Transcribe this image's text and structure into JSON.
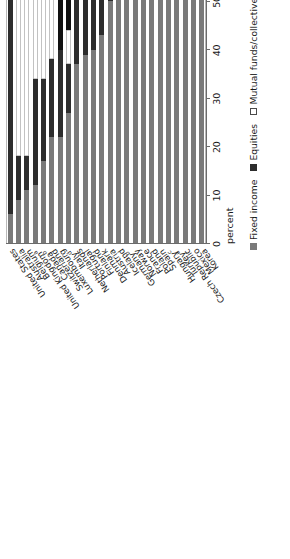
{
  "chart_data": {
    "type": "bar",
    "orientation": "horizontal-stacked",
    "title": "",
    "xlabel": "percent",
    "ylabel": "",
    "xlim": [
      0,
      100
    ],
    "grid": false,
    "legend_position": "bottom",
    "tick_labels": [
      "100",
      "90",
      "80",
      "70",
      "60",
      "50",
      "40",
      "30",
      "20",
      "10",
      "0"
    ],
    "tick_values": [
      100,
      90,
      80,
      70,
      60,
      50,
      40,
      30,
      20,
      10,
      0
    ],
    "axis_title": "percent",
    "series": [
      {
        "name": "Fixed income",
        "color": "#7a7a7a",
        "swatch": "fixed"
      },
      {
        "name": "Equities",
        "color": "#2d2d2d",
        "swatch": "equities"
      },
      {
        "name": "Mutual funds/collective investment schemes",
        "color": "#ffffff",
        "swatch": "mutual"
      },
      {
        "name": "Other",
        "color": "#111111",
        "swatch": "other"
      }
    ],
    "categories": [
      "United States",
      "Australia",
      "Belgium",
      "United Kingdom",
      "Canada",
      "Switzerland",
      "Luxembourg",
      "Italy",
      "Netherlands",
      "Portugal",
      "Finland",
      "Denmark",
      "Austria",
      "Iceland",
      "Germany",
      "Norway",
      "France",
      "Poland",
      "Spain",
      "Hungary",
      "Turkey",
      "Czech Republic",
      "Mexico",
      "Korea"
    ],
    "category_footnotes": {
      "United Kingdom": "a",
      "Switzerland": "b",
      "Italy": "d",
      "Germany": "b",
      "Hungary": "c",
      "Turkey": "a"
    },
    "rows": [
      {
        "category": "United States",
        "footnote": "",
        "fixed": 6,
        "equities": 60,
        "mutual": 28,
        "other": 6
      },
      {
        "category": "Australia",
        "footnote": "",
        "fixed": 9,
        "equities": 9,
        "mutual": 80,
        "other": 2
      },
      {
        "category": "Belgium",
        "footnote": "",
        "fixed": 11,
        "equities": 7,
        "mutual": 65,
        "other": 17
      },
      {
        "category": "United Kingdom",
        "footnote": "a",
        "fixed": 12,
        "equities": 22,
        "mutual": 45,
        "other": 21
      },
      {
        "category": "Canada",
        "footnote": "b",
        "fixed": 17,
        "equities": 17,
        "mutual": 52,
        "other": 14
      },
      {
        "category": "Switzerland",
        "footnote": "",
        "fixed": 22,
        "equities": 16,
        "mutual": 39,
        "other": 23
      },
      {
        "category": "Luxembourg",
        "footnote": "",
        "fixed": 22,
        "equities": 18,
        "mutual": 0,
        "other": 60
      },
      {
        "category": "Italy",
        "footnote": "d",
        "fixed": 27,
        "equities": 10,
        "mutual": 7,
        "other": 56
      },
      {
        "category": "Netherlands",
        "footnote": "",
        "fixed": 37,
        "equities": 48,
        "mutual": 0,
        "other": 15
      },
      {
        "category": "Portugal",
        "footnote": "",
        "fixed": 39,
        "equities": 26,
        "mutual": 23,
        "other": 12
      },
      {
        "category": "Finland",
        "footnote": "",
        "fixed": 40,
        "equities": 49,
        "mutual": 0,
        "other": 11
      },
      {
        "category": "Denmark",
        "footnote": "",
        "fixed": 43,
        "equities": 27,
        "mutual": 14,
        "other": 16
      },
      {
        "category": "Austria",
        "footnote": "",
        "fixed": 50,
        "equities": 39,
        "mutual": 0,
        "other": 11
      },
      {
        "category": "Iceland",
        "footnote": "",
        "fixed": 52,
        "equities": 42,
        "mutual": 2,
        "other": 4
      },
      {
        "category": "Germany",
        "footnote": "b",
        "fixed": 53,
        "equities": 36,
        "mutual": 0,
        "other": 11
      },
      {
        "category": "Norway",
        "footnote": "",
        "fixed": 55,
        "equities": 38,
        "mutual": 0,
        "other": 7
      },
      {
        "category": "France",
        "footnote": "",
        "fixed": 60,
        "equities": 6,
        "mutual": 28,
        "other": 6
      },
      {
        "category": "Poland",
        "footnote": "",
        "fixed": 62,
        "equities": 38,
        "mutual": 0,
        "other": 0
      },
      {
        "category": "Spain",
        "footnote": "",
        "fixed": 68,
        "equities": 13,
        "mutual": 9,
        "other": 10
      },
      {
        "category": "Hungary",
        "footnote": "c",
        "fixed": 71,
        "equities": 10,
        "mutual": 9,
        "other": 10
      },
      {
        "category": "Turkey",
        "footnote": "a",
        "fixed": 83,
        "equities": 11,
        "mutual": 0,
        "other": 6
      },
      {
        "category": "Czech Republic",
        "footnote": "",
        "fixed": 78,
        "equities": 0,
        "mutual": 0,
        "other": 22
      },
      {
        "category": "Mexico",
        "footnote": "",
        "fixed": 95,
        "equities": 0,
        "mutual": 0,
        "other": 5
      },
      {
        "category": "Korea",
        "footnote": "",
        "fixed": 93,
        "equities": 0,
        "mutual": 0,
        "other": 7
      }
    ]
  }
}
